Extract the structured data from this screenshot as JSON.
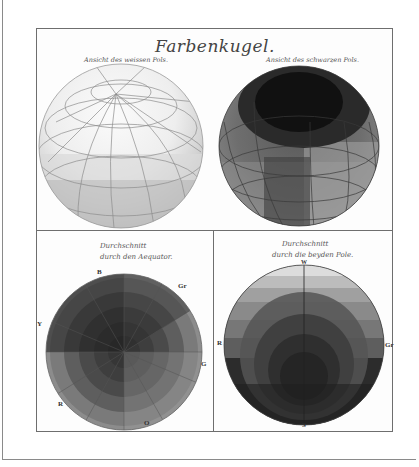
{
  "plate": {
    "title": "Farbenkugel.",
    "top_left_caption": "Ansicht des weissen Pols.",
    "top_right_caption": "Ansicht des schwarzen Pols.",
    "bottom_left_caption_line1": "Durchschnitt",
    "bottom_left_caption_line2": "durch den Aequator.",
    "bottom_right_caption_line1": "Durchschnitt",
    "bottom_right_caption_line2": "durch die beyden Pole."
  },
  "equator_section_labels": {
    "top": "B",
    "top_right": "Gr",
    "left": "Y",
    "right": "G",
    "bottom_left": "R",
    "bottom": "O"
  },
  "pole_section_labels": {
    "top": "W",
    "left": "R",
    "right": "Gr",
    "bottom": "S"
  },
  "colors": {
    "paper": "#fdfdfd",
    "border": "#6e6e6e",
    "ink": "#444444"
  }
}
